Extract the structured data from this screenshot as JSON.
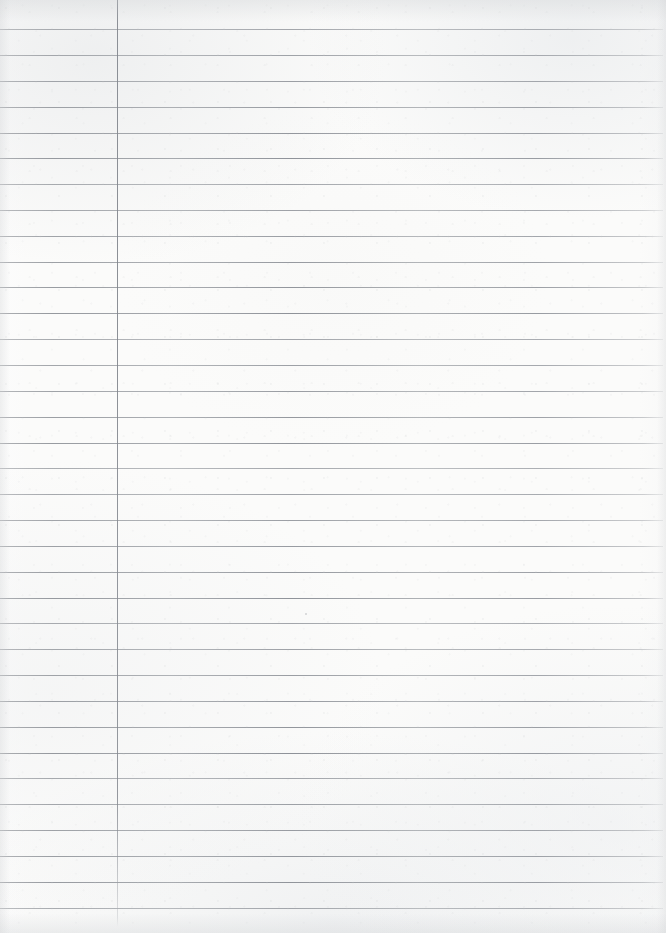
{
  "sheet": {
    "kind": "ruled-notebook-paper",
    "description": "Blank sheet of lined notebook paper, scanned",
    "width_px": 666,
    "height_px": 933,
    "paper_color": "#fbfbfa",
    "rule_color": "#8c9096",
    "margin_rule_color": "#82868d",
    "written_text": "",
    "notes_count": 0
  },
  "ruling": {
    "rule_count": 35,
    "first_rule_y": 29,
    "rule_spacing_px": 25.85,
    "rule_thickness_px": 1,
    "rule_left_x": 0,
    "rule_right_x": 663,
    "rule_y_positions": [
      29,
      55,
      81,
      107,
      133,
      158,
      184,
      210,
      236,
      262,
      287,
      313,
      339,
      365,
      391,
      417,
      443,
      468,
      494,
      520,
      546,
      572,
      598,
      623,
      649,
      675,
      701,
      727,
      753,
      778,
      804,
      830,
      856,
      882,
      908
    ]
  },
  "margin": {
    "label": "left-margin-rule",
    "x": 117,
    "top_y": 0,
    "bottom_y": 927,
    "thickness_px": 1
  },
  "marks": [
    {
      "label": "paper-speck",
      "x": 305,
      "y": 613,
      "size_px": 2
    }
  ]
}
